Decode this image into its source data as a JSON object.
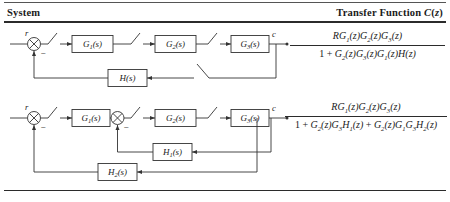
{
  "header": {
    "col_system": "System",
    "col_transfer": "Transfer Function C(z)"
  },
  "rows": [
    {
      "id": "row-1",
      "diagram": {
        "input_label": "r",
        "output_label": "c",
        "minus_sign": "−",
        "blocks": [
          {
            "name": "G1",
            "label_main": "G",
            "label_sub": "1",
            "label_arg": "(s)"
          },
          {
            "name": "G2",
            "label_main": "G",
            "label_sub": "2",
            "label_arg": "(s)"
          },
          {
            "name": "G3",
            "label_main": "G",
            "label_sub": "3",
            "label_arg": "(s)"
          },
          {
            "name": "H",
            "label_main": "H",
            "label_sub": "",
            "label_arg": "(s)"
          }
        ],
        "samplers": 4
      },
      "transfer": {
        "numerator": {
          "parts": [
            {
              "t": "RG",
              "style": "i"
            },
            {
              "t": "1",
              "style": "sub"
            },
            {
              "t": "(z)",
              "style": "i"
            },
            {
              "t": "G",
              "style": "i"
            },
            {
              "t": "2",
              "style": "sub"
            },
            {
              "t": "(z)",
              "style": "i"
            },
            {
              "t": "G",
              "style": "i"
            },
            {
              "t": "3",
              "style": "sub"
            },
            {
              "t": "(z)",
              "style": "i"
            }
          ],
          "plain": "RG1(z)G2(z)G3(z)"
        },
        "denominator": {
          "parts": [
            {
              "t": "1 + ",
              "style": "n"
            },
            {
              "t": "G",
              "style": "i"
            },
            {
              "t": "2",
              "style": "sub"
            },
            {
              "t": "(z)",
              "style": "i"
            },
            {
              "t": "G",
              "style": "i"
            },
            {
              "t": "3",
              "style": "sub"
            },
            {
              "t": "(z)",
              "style": "i"
            },
            {
              "t": "G",
              "style": "i"
            },
            {
              "t": "1",
              "style": "sub"
            },
            {
              "t": "(z)",
              "style": "i"
            },
            {
              "t": "H",
              "style": "i"
            },
            {
              "t": "(z)",
              "style": "i"
            }
          ],
          "plain": "1 + G2(z)G3(z)G1(z)H(z)"
        }
      }
    },
    {
      "id": "row-2",
      "diagram": {
        "input_label": "r",
        "output_label": "c",
        "minus_sign": "−",
        "blocks": [
          {
            "name": "G1",
            "label_main": "G",
            "label_sub": "1",
            "label_arg": "(s)"
          },
          {
            "name": "G2",
            "label_main": "G",
            "label_sub": "2",
            "label_arg": "(s)"
          },
          {
            "name": "G3",
            "label_main": "G",
            "label_sub": "3",
            "label_arg": "(s)"
          },
          {
            "name": "H1",
            "label_main": "H",
            "label_sub": "1",
            "label_arg": "(s)"
          },
          {
            "name": "H2",
            "label_main": "H",
            "label_sub": "2",
            "label_arg": "(s)"
          }
        ],
        "samplers": 3
      },
      "transfer": {
        "numerator": {
          "parts": [
            {
              "t": "RG",
              "style": "i"
            },
            {
              "t": "1",
              "style": "sub"
            },
            {
              "t": "(z)",
              "style": "i"
            },
            {
              "t": "G",
              "style": "i"
            },
            {
              "t": "2",
              "style": "sub"
            },
            {
              "t": "(z)",
              "style": "i"
            },
            {
              "t": "G",
              "style": "i"
            },
            {
              "t": "3",
              "style": "sub"
            },
            {
              "t": "(z)",
              "style": "i"
            }
          ],
          "plain": "RG1(z)G2(z)G3(z)"
        },
        "denominator": {
          "parts": [
            {
              "t": "1 + ",
              "style": "n"
            },
            {
              "t": "G",
              "style": "i"
            },
            {
              "t": "2",
              "style": "sub"
            },
            {
              "t": "(z)",
              "style": "i"
            },
            {
              "t": "G",
              "style": "i"
            },
            {
              "t": "3",
              "style": "sub"
            },
            {
              "t": "H",
              "style": "i"
            },
            {
              "t": "1",
              "style": "sub"
            },
            {
              "t": "(z)",
              "style": "i"
            },
            {
              "t": " + ",
              "style": "n"
            },
            {
              "t": "G",
              "style": "i"
            },
            {
              "t": "2",
              "style": "sub"
            },
            {
              "t": "(z)",
              "style": "i"
            },
            {
              "t": "G",
              "style": "i"
            },
            {
              "t": "1",
              "style": "sub"
            },
            {
              "t": "G",
              "style": "i"
            },
            {
              "t": "3",
              "style": "sub"
            },
            {
              "t": "H",
              "style": "i"
            },
            {
              "t": "2",
              "style": "sub"
            },
            {
              "t": "(z)",
              "style": "i"
            }
          ],
          "plain": "1 + G2(z)G3H1(z) + G2(z)G1G3H2(z)"
        }
      }
    }
  ],
  "colors": {
    "rule": "#2b2b2b",
    "wire": "#333333",
    "text": "#1a1a1a",
    "background": "#ffffff"
  }
}
